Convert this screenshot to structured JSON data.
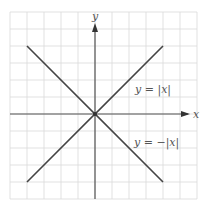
{
  "chart_data": {
    "type": "line",
    "title": "",
    "xlabel": "x",
    "ylabel": "y",
    "xlim": [
      -5,
      6
    ],
    "ylim": [
      -5,
      6
    ],
    "grid": true,
    "grid_step": 1,
    "series": [
      {
        "name": "y = |x|",
        "x": [
          -4,
          0,
          4
        ],
        "y": [
          4,
          0,
          4
        ]
      },
      {
        "name": "y = −|x|",
        "x": [
          -4,
          0,
          4
        ],
        "y": [
          -4,
          0,
          -4
        ]
      }
    ],
    "annotations": [
      {
        "text": "y = |x|",
        "x": 4.2,
        "y": 2
      },
      {
        "text": "y = −|x|",
        "x": 4.2,
        "y": -1.6
      }
    ]
  },
  "labels": {
    "x_axis": "x",
    "y_axis": "y",
    "abs_label": "y = |x|",
    "neg_abs_label": "y = −|x|"
  },
  "colors": {
    "grid": "#d9d9d9",
    "axis": "#555555",
    "line": "#444444"
  }
}
